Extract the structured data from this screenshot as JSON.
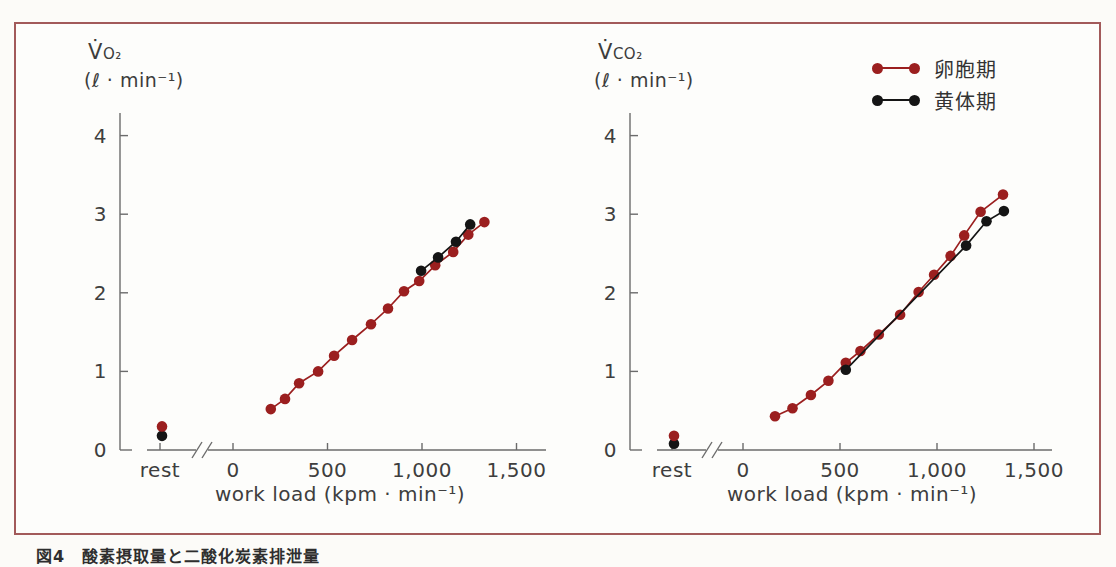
{
  "panel": {
    "border_color": "#a25a5a",
    "background": "#fdfdfb"
  },
  "caption": {
    "text": "図4　酸素摂取量と二酸化炭素排泄量"
  },
  "colors": {
    "follicular": "#9b1f1f",
    "luteal": "#151515",
    "axis": "#6b6b6b",
    "text": "#3e3e3e"
  },
  "legend": {
    "items": [
      {
        "label": "卵胞期",
        "color": "#9b1f1f"
      },
      {
        "label": "黄体期",
        "color": "#151515"
      }
    ]
  },
  "chart_data": [
    {
      "type": "line",
      "name": "vo2-chart",
      "ylabel_main": "V̇",
      "ylabel_sub": "O₂",
      "ylabel_unit": "(ℓ · min⁻¹)",
      "xlabel": "work load (kpm · min⁻¹)",
      "rest_label": "rest",
      "x_tick_labels": [
        "0",
        "500",
        "1,000",
        "1,500"
      ],
      "x_tick_values": [
        0,
        500,
        1000,
        1500
      ],
      "y_ticks": [
        0,
        1,
        2,
        3,
        4
      ],
      "xlim": [
        0,
        1600
      ],
      "ylim": [
        0,
        4.3
      ],
      "x_axis_break": true,
      "series": [
        {
          "name": "卵胞期",
          "color": "#9b1f1f",
          "rest": 0.3,
          "points": [
            [
              200,
              0.52
            ],
            [
              275,
              0.65
            ],
            [
              350,
              0.85
            ],
            [
              450,
              1.0
            ],
            [
              535,
              1.2
            ],
            [
              630,
              1.4
            ],
            [
              730,
              1.6
            ],
            [
              820,
              1.8
            ],
            [
              905,
              2.02
            ],
            [
              985,
              2.15
            ],
            [
              1070,
              2.35
            ],
            [
              1165,
              2.52
            ],
            [
              1245,
              2.74
            ],
            [
              1330,
              2.9
            ]
          ]
        },
        {
          "name": "黄体期",
          "color": "#151515",
          "rest": 0.18,
          "points": [
            [
              995,
              2.28
            ],
            [
              1085,
              2.45
            ],
            [
              1180,
              2.65
            ],
            [
              1255,
              2.87
            ]
          ]
        }
      ]
    },
    {
      "type": "line",
      "name": "vco2-chart",
      "ylabel_main": "V̇",
      "ylabel_sub": "CO₂",
      "ylabel_unit": "(ℓ · min⁻¹)",
      "xlabel": "work load (kpm · min⁻¹)",
      "rest_label": "rest",
      "x_tick_labels": [
        "0",
        "500",
        "1,000",
        "1,500"
      ],
      "x_tick_values": [
        0,
        500,
        1000,
        1500
      ],
      "y_ticks": [
        0,
        1,
        2,
        3,
        4
      ],
      "xlim": [
        0,
        1600
      ],
      "ylim": [
        0,
        4.3
      ],
      "x_axis_break": true,
      "series": [
        {
          "name": "卵胞期",
          "color": "#9b1f1f",
          "rest": 0.18,
          "points": [
            [
              165,
              0.43
            ],
            [
              255,
              0.53
            ],
            [
              350,
              0.7
            ],
            [
              440,
              0.88
            ],
            [
              530,
              1.11
            ],
            [
              605,
              1.26
            ],
            [
              700,
              1.47
            ],
            [
              810,
              1.72
            ],
            [
              905,
              2.01
            ],
            [
              985,
              2.23
            ],
            [
              1070,
              2.47
            ],
            [
              1140,
              2.73
            ],
            [
              1225,
              3.03
            ],
            [
              1340,
              3.25
            ]
          ]
        },
        {
          "name": "黄体期",
          "color": "#151515",
          "rest": 0.08,
          "points": [
            [
              530,
              1.02
            ],
            [
              1150,
              2.6
            ],
            [
              1255,
              2.91
            ],
            [
              1345,
              3.04
            ]
          ]
        }
      ]
    }
  ]
}
